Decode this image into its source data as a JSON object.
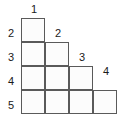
{
  "figure": {
    "title": "",
    "type": "staircase-grid-diagram",
    "colors": {
      "background": "#ffffff",
      "cell_fill": "#fcfcfc",
      "cell_border": "#5a5a5a",
      "label_text": "#1a1a1a"
    },
    "grid": {
      "rows": 4,
      "columns": 4,
      "cell_size_px": 24,
      "origin_x_px": 21,
      "origin_y_px": 18,
      "shape": "staircase",
      "row_cell_counts": [
        1,
        2,
        3,
        4
      ],
      "total_cells": 10
    },
    "column_labels": [
      {
        "text": "1",
        "x": 27,
        "y": 4
      },
      {
        "text": "2",
        "x": 51,
        "y": 28
      },
      {
        "text": "3",
        "x": 75,
        "y": 52
      },
      {
        "text": "4",
        "x": 99,
        "y": 66
      }
    ],
    "row_labels": [
      {
        "text": "2",
        "x": 4,
        "y": 28
      },
      {
        "text": "3",
        "x": 4,
        "y": 52
      },
      {
        "text": "4",
        "x": 4,
        "y": 76
      },
      {
        "text": "5",
        "x": 4,
        "y": 100
      }
    ],
    "cells": [
      {
        "row": 0,
        "col": 0
      },
      {
        "row": 1,
        "col": 0
      },
      {
        "row": 1,
        "col": 1
      },
      {
        "row": 2,
        "col": 0
      },
      {
        "row": 2,
        "col": 1
      },
      {
        "row": 2,
        "col": 2
      },
      {
        "row": 3,
        "col": 0
      },
      {
        "row": 3,
        "col": 1
      },
      {
        "row": 3,
        "col": 2
      },
      {
        "row": 3,
        "col": 3
      }
    ]
  }
}
